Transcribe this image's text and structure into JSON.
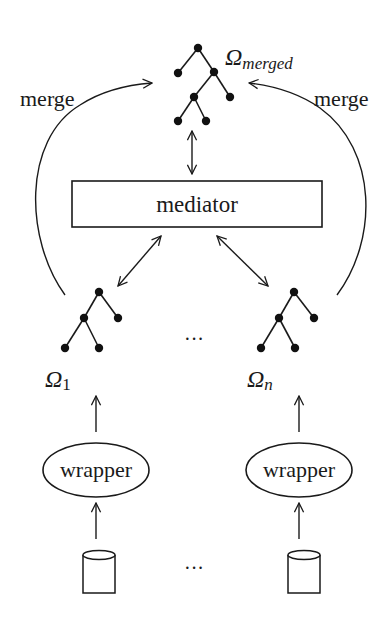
{
  "diagram": {
    "type": "mediator-wrapper architecture",
    "colors": {
      "ink": "#1a1a1a",
      "background": "#ffffff"
    },
    "merged_schema": {
      "label_symbol": "Ω",
      "label_subscript": "merged"
    },
    "merge_arrows": {
      "left_label": "merge",
      "right_label": "merge"
    },
    "mediator": {
      "label": "mediator"
    },
    "sources": [
      {
        "schema_symbol": "Ω",
        "schema_subscript": "1",
        "wrapper_label": "wrapper",
        "datasource": "database-cylinder"
      },
      {
        "schema_symbol": "Ω",
        "schema_subscript": "n",
        "wrapper_label": "wrapper",
        "datasource": "database-cylinder"
      }
    ],
    "ellipsis_trees": "···",
    "ellipsis_databases": "···"
  }
}
